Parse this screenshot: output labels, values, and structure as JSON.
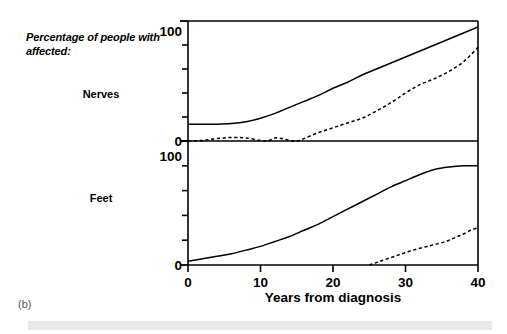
{
  "figure": {
    "caption": "(b)",
    "side_label": "Percentage of people with affected:",
    "panel_labels": {
      "top": "Nerves",
      "bottom": "Feet"
    },
    "xlabel": "Years from diagnosis",
    "xticklabels": [
      "0",
      "10",
      "20",
      "30",
      "40"
    ],
    "yticklabels_top": [
      "0",
      "100"
    ],
    "yticklabels_bottom": [
      "0",
      "100"
    ],
    "colors": {
      "line": "#000000",
      "frame": "#000000",
      "bottom_bar": "#e7e9ec",
      "caption": "#55585c"
    }
  },
  "chart_data": {
    "type": "line",
    "title": "",
    "subtitle": "",
    "xlabel": "Years from diagnosis",
    "ylabel": "Percentage of people with affected:",
    "xlim": [
      0,
      40
    ],
    "ylim": [
      0,
      100
    ],
    "xticks": [
      0,
      10,
      20,
      30,
      40
    ],
    "yticks": [
      0,
      20,
      40,
      60,
      80,
      100
    ],
    "grid": false,
    "legend": "none",
    "panels": [
      {
        "name": "Nerves",
        "label": "Nerves",
        "ylim": [
          0,
          100
        ],
        "yticks": [
          0,
          20,
          40,
          60,
          80,
          100
        ],
        "yticklabels": [
          "0",
          "100"
        ],
        "series": [
          {
            "name": "Nerves - solid",
            "style": "solid",
            "x": [
              0,
              2,
              4,
              6,
              8,
              10,
              12,
              14,
              16,
              18,
              20,
              22,
              24,
              26,
              28,
              30,
              32,
              34,
              36,
              38,
              40
            ],
            "values": [
              14,
              14,
              14,
              14.5,
              16,
              19,
              23,
              28,
              33,
              38,
              44,
              49,
              55,
              60,
              65,
              70,
              75,
              80,
              85,
              90,
              95
            ]
          },
          {
            "name": "Nerves - dashed",
            "style": "dashed",
            "x": [
              0,
              2,
              4,
              6,
              8,
              10,
              11,
              12,
              13,
              14,
              15,
              16,
              18,
              20,
              22,
              24,
              26,
              28,
              30,
              32,
              34,
              36,
              38,
              40
            ],
            "values": [
              0,
              0.5,
              2,
              3,
              2.5,
              0.5,
              0,
              2.5,
              2,
              0.5,
              0,
              2,
              7,
              11,
              15,
              19,
              25,
              32,
              40,
              47,
              52,
              58,
              66,
              78
            ]
          }
        ]
      },
      {
        "name": "Feet",
        "label": "Feet",
        "ylim": [
          0,
          100
        ],
        "yticks": [
          0,
          20,
          40,
          60,
          80,
          100
        ],
        "yticklabels": [
          "0",
          "100"
        ],
        "series": [
          {
            "name": "Feet - solid",
            "style": "solid",
            "x": [
              0,
              2,
              4,
              6,
              8,
              10,
              12,
              14,
              16,
              18,
              20,
              22,
              24,
              26,
              28,
              30,
              32,
              34,
              36,
              38,
              40
            ],
            "values": [
              3,
              5,
              7,
              9,
              12,
              15,
              19,
              23,
              28,
              33,
              39,
              45,
              51,
              57,
              63,
              68,
              73,
              77,
              79,
              80,
              80
            ]
          },
          {
            "name": "Feet - dashed",
            "style": "dashed",
            "x": [
              25,
              26,
              27,
              28,
              29,
              30,
              31,
              32,
              33,
              34,
              35,
              36,
              37,
              38,
              39,
              40
            ],
            "values": [
              0,
              2,
              4,
              6,
              8,
              10,
              12,
              13.5,
              15,
              16.5,
              18,
              20,
              22.5,
              25,
              28,
              30
            ]
          }
        ]
      }
    ]
  }
}
